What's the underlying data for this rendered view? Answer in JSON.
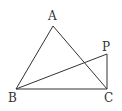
{
  "diagram": {
    "type": "geometry",
    "points": {
      "A": {
        "label": "A",
        "x": 53,
        "y": 26,
        "lx": 48,
        "ly": 20
      },
      "B": {
        "label": "B",
        "x": 16,
        "y": 89,
        "lx": 8,
        "ly": 102
      },
      "C": {
        "label": "C",
        "x": 107,
        "y": 89,
        "lx": 104,
        "ly": 102
      },
      "P": {
        "label": "P",
        "x": 107,
        "y": 54,
        "lx": 102,
        "ly": 51
      }
    },
    "segments": [
      [
        "A",
        "B"
      ],
      [
        "A",
        "C"
      ],
      [
        "B",
        "C"
      ],
      [
        "B",
        "P"
      ],
      [
        "P",
        "C"
      ]
    ],
    "stroke_color": "#333333"
  }
}
